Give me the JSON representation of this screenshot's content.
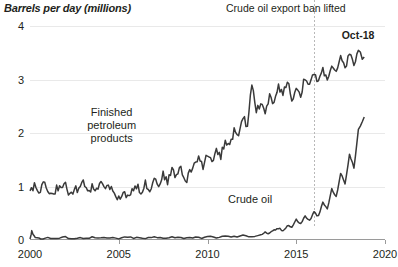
{
  "chart_data": {
    "type": "line",
    "title": "Barrels per day (millions)",
    "ylabel": "",
    "xlabel": "",
    "xlim": [
      2000,
      2020
    ],
    "ylim": [
      0,
      4
    ],
    "grid": true,
    "legend_position": "inline-annotations",
    "yticks": [
      "0",
      "1",
      "2",
      "3",
      "4"
    ],
    "ytick_values": [
      0,
      1,
      2,
      3,
      4
    ],
    "xticks": [
      "2000",
      "2005",
      "2010",
      "2015",
      "2020"
    ],
    "xtick_values": [
      2000,
      2005,
      2010,
      2015,
      2020
    ],
    "line_color": "#3a3a3a",
    "grid_color": "#e9e9e9",
    "annotations": [
      {
        "id": "export-ban",
        "text": "Crude oil export ban lifted",
        "x": 2016.0
      },
      {
        "id": "last-point",
        "text": "Oct-18",
        "x": 2018.8,
        "y": 3.45
      }
    ],
    "series": [
      {
        "name": "Finished petroleum products",
        "label_x": 2004.6,
        "label_y": 2.35,
        "x": [
          2000.0,
          2000.25,
          2000.5,
          2000.75,
          2001.0,
          2001.25,
          2001.5,
          2001.75,
          2002.0,
          2002.25,
          2002.5,
          2002.75,
          2003.0,
          2003.25,
          2003.5,
          2003.75,
          2004.0,
          2004.25,
          2004.5,
          2004.75,
          2005.0,
          2005.25,
          2005.5,
          2005.75,
          2006.0,
          2006.25,
          2006.5,
          2006.75,
          2007.0,
          2007.25,
          2007.5,
          2007.75,
          2008.0,
          2008.25,
          2008.5,
          2008.75,
          2009.0,
          2009.25,
          2009.5,
          2009.75,
          2010.0,
          2010.25,
          2010.5,
          2010.75,
          2011.0,
          2011.25,
          2011.5,
          2011.75,
          2012.0,
          2012.25,
          2012.5,
          2012.75,
          2013.0,
          2013.25,
          2013.5,
          2013.75,
          2014.0,
          2014.25,
          2014.5,
          2014.75,
          2015.0,
          2015.25,
          2015.5,
          2015.75,
          2016.0,
          2016.25,
          2016.5,
          2016.75,
          2017.0,
          2017.25,
          2017.5,
          2017.75,
          2018.0,
          2018.25,
          2018.5,
          2018.83
        ],
        "values": [
          0.92,
          1.02,
          0.88,
          1.05,
          0.96,
          0.8,
          0.99,
          0.93,
          1.05,
          0.84,
          0.97,
          0.91,
          1.06,
          0.88,
          1.0,
          0.95,
          1.1,
          0.92,
          1.01,
          0.86,
          0.76,
          0.9,
          0.84,
          0.95,
          1.02,
          0.88,
          1.06,
          0.95,
          1.16,
          1.03,
          1.22,
          1.1,
          1.31,
          1.18,
          1.4,
          1.05,
          1.27,
          1.42,
          1.55,
          1.34,
          1.62,
          1.48,
          1.7,
          1.56,
          1.88,
          1.74,
          2.05,
          1.9,
          2.3,
          2.12,
          2.96,
          2.42,
          2.55,
          2.4,
          2.68,
          2.52,
          2.9,
          2.7,
          3.02,
          2.6,
          2.85,
          2.72,
          3.05,
          2.88,
          3.1,
          2.95,
          3.18,
          3.02,
          3.25,
          3.1,
          3.4,
          3.18,
          3.52,
          3.28,
          3.5,
          3.42
        ]
      },
      {
        "name": "Crude oil",
        "label_x": 2012.4,
        "label_y": 0.72,
        "x": [
          2000.0,
          2000.1,
          2000.3,
          2000.6,
          2001.0,
          2001.5,
          2002.0,
          2002.5,
          2003.0,
          2003.5,
          2004.0,
          2004.5,
          2005.0,
          2005.5,
          2006.0,
          2006.5,
          2007.0,
          2007.5,
          2008.0,
          2008.5,
          2009.0,
          2009.5,
          2010.0,
          2010.5,
          2011.0,
          2011.5,
          2012.0,
          2012.5,
          2013.0,
          2013.25,
          2013.5,
          2013.75,
          2014.0,
          2014.25,
          2014.5,
          2014.75,
          2015.0,
          2015.25,
          2015.5,
          2015.75,
          2016.0,
          2016.25,
          2016.5,
          2016.75,
          2017.0,
          2017.25,
          2017.5,
          2017.75,
          2018.0,
          2018.25,
          2018.5,
          2018.83
        ],
        "values": [
          0.02,
          0.16,
          0.05,
          0.03,
          0.04,
          0.03,
          0.05,
          0.03,
          0.04,
          0.05,
          0.03,
          0.04,
          0.03,
          0.05,
          0.04,
          0.03,
          0.05,
          0.04,
          0.06,
          0.04,
          0.05,
          0.04,
          0.06,
          0.05,
          0.07,
          0.06,
          0.08,
          0.07,
          0.1,
          0.14,
          0.12,
          0.18,
          0.22,
          0.17,
          0.28,
          0.24,
          0.38,
          0.3,
          0.45,
          0.36,
          0.52,
          0.44,
          0.7,
          0.58,
          0.95,
          0.8,
          1.25,
          1.05,
          1.6,
          1.35,
          2.05,
          2.3
        ]
      }
    ]
  }
}
